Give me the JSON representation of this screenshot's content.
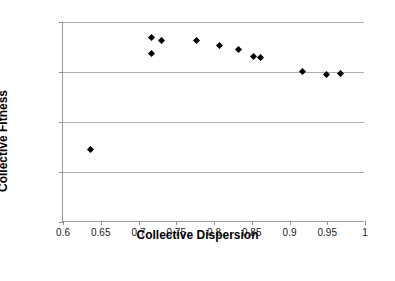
{
  "chart_data": {
    "type": "scatter",
    "title": "",
    "xlabel": "Collective Dispersion",
    "ylabel": "Collective Fitness",
    "xlim": [
      0.6,
      1.0
    ],
    "ylim": [
      50,
      90
    ],
    "xticks": [
      0.6,
      0.65,
      0.7,
      0.75,
      0.8,
      0.85,
      0.9,
      0.95,
      1
    ],
    "xticklabels": [
      "0.6",
      "0.65",
      "0.7",
      "0.75",
      "0.8",
      "0.85",
      "0.9",
      "0.95",
      "1"
    ],
    "yticks": [
      50,
      60,
      70,
      80,
      90
    ],
    "yticklabels": [
      "50",
      "60",
      "70",
      "80",
      "90"
    ],
    "grid": "horizontal",
    "legend": "none",
    "marker": "diamond",
    "marker_color": "#000000",
    "series": [
      {
        "name": "Collective Fitness vs Collective Dispersion",
        "points": [
          {
            "x": 0.637,
            "y": 64.6
          },
          {
            "x": 0.717,
            "y": 87.0
          },
          {
            "x": 0.717,
            "y": 83.8
          },
          {
            "x": 0.731,
            "y": 86.4
          },
          {
            "x": 0.777,
            "y": 86.4
          },
          {
            "x": 0.807,
            "y": 85.4
          },
          {
            "x": 0.833,
            "y": 84.6
          },
          {
            "x": 0.852,
            "y": 83.2
          },
          {
            "x": 0.861,
            "y": 83.0
          },
          {
            "x": 0.917,
            "y": 80.2
          },
          {
            "x": 0.949,
            "y": 79.6
          },
          {
            "x": 0.967,
            "y": 79.8
          }
        ]
      }
    ]
  }
}
